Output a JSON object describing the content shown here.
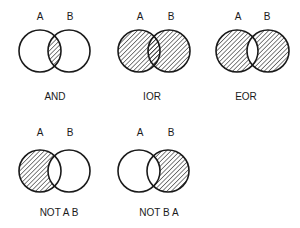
{
  "diagram": {
    "type": "venn-logic-operations",
    "colors": {
      "background": "#ffffff",
      "stroke": "#1a1a1a",
      "hatch": "#1a1a1a"
    },
    "panels": [
      {
        "id": "and",
        "caption": "AND",
        "label_a": "A",
        "label_b": "B",
        "shaded_region": "A∩B",
        "circle_a": {
          "cx": 40,
          "cy": 51,
          "r": 21
        },
        "circle_b": {
          "cx": 69,
          "cy": 51,
          "r": 21
        },
        "label_a_pos": {
          "x": 40,
          "y": 12
        },
        "label_b_pos": {
          "x": 70,
          "y": 12
        },
        "caption_pos": {
          "x": 55,
          "y": 92
        }
      },
      {
        "id": "ior",
        "caption": "IOR",
        "label_a": "A",
        "label_b": "B",
        "shaded_region": "A∪B",
        "circle_a": {
          "cx": 139,
          "cy": 51,
          "r": 21
        },
        "circle_b": {
          "cx": 169,
          "cy": 51,
          "r": 21
        },
        "label_a_pos": {
          "x": 140,
          "y": 12
        },
        "label_b_pos": {
          "x": 171,
          "y": 12
        },
        "caption_pos": {
          "x": 152,
          "y": 92
        }
      },
      {
        "id": "eor",
        "caption": "EOR",
        "label_a": "A",
        "label_b": "B",
        "shaded_region": "A⊕B",
        "circle_a": {
          "cx": 237,
          "cy": 51,
          "r": 21
        },
        "circle_b": {
          "cx": 268,
          "cy": 51,
          "r": 21
        },
        "label_a_pos": {
          "x": 238,
          "y": 12
        },
        "label_b_pos": {
          "x": 267,
          "y": 12
        },
        "caption_pos": {
          "x": 246,
          "y": 92
        }
      },
      {
        "id": "not-a-b",
        "caption": "NOT A B",
        "label_a": "A",
        "label_b": "B",
        "shaded_region": "A−B",
        "circle_a": {
          "cx": 40,
          "cy": 171,
          "r": 21
        },
        "circle_b": {
          "cx": 69,
          "cy": 171,
          "r": 21
        },
        "label_a_pos": {
          "x": 40,
          "y": 128
        },
        "label_b_pos": {
          "x": 70,
          "y": 128
        },
        "caption_pos": {
          "x": 59,
          "y": 208
        }
      },
      {
        "id": "not-b-a",
        "caption": "NOT B A",
        "label_a": "A",
        "label_b": "B",
        "shaded_region": "B−A",
        "circle_a": {
          "cx": 139,
          "cy": 171,
          "r": 21
        },
        "circle_b": {
          "cx": 168,
          "cy": 171,
          "r": 21
        },
        "label_a_pos": {
          "x": 140,
          "y": 128
        },
        "label_b_pos": {
          "x": 171,
          "y": 128
        },
        "caption_pos": {
          "x": 159,
          "y": 208
        }
      }
    ]
  }
}
